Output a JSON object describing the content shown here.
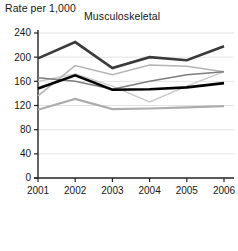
{
  "chart_data": {
    "type": "line",
    "title": "Musculoskeletal",
    "ylabel": "Rate per 1,000",
    "xlabel": "",
    "categories": [
      "2001",
      "2002",
      "2003",
      "2004",
      "2005",
      "2006"
    ],
    "x": [
      2001,
      2002,
      2003,
      2004,
      2005,
      2006
    ],
    "ylim": [
      0,
      240
    ],
    "yticks": [
      0,
      40,
      80,
      120,
      160,
      200,
      240
    ],
    "ytick_labels": [
      "0",
      "40",
      "80",
      "120",
      "160",
      "200",
      "240"
    ],
    "grid": true,
    "grid_axis": "y",
    "legend": false,
    "legend_position": "none",
    "series": [
      {
        "name": "series-1-dark",
        "color": "#3a3a3a",
        "width": 2.6,
        "values": [
          198,
          225,
          182,
          200,
          195,
          218
        ]
      },
      {
        "name": "series-2-black",
        "color": "#000000",
        "width": 2.6,
        "values": [
          148,
          170,
          146,
          147,
          150,
          157
        ]
      },
      {
        "name": "series-3-mid-gray",
        "color": "#7d7d7d",
        "width": 1.5,
        "values": [
          166,
          160,
          147,
          160,
          171,
          176
        ]
      },
      {
        "name": "series-4-light-gray",
        "color": "#b4b4b4",
        "width": 1.5,
        "values": [
          136,
          186,
          171,
          187,
          185,
          176
        ]
      },
      {
        "name": "series-5-pale-gray",
        "color": "#adadad",
        "width": 2.2,
        "values": [
          113,
          131,
          114,
          115,
          117,
          119
        ]
      },
      {
        "name": "series-6-faint-gray",
        "color": "#c9c9c9",
        "width": 1.4,
        "values": [
          160,
          172,
          152,
          126,
          152,
          176
        ]
      }
    ],
    "axis": {
      "x_start_px": 38,
      "x_end_px": 224,
      "y_top_px": 33,
      "y_bottom_px": 178
    }
  }
}
